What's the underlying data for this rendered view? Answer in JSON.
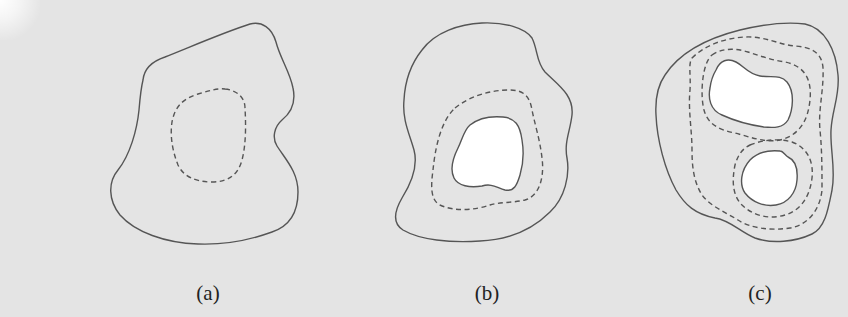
{
  "figure": {
    "background_color": "#e4e4e4",
    "line_color": "#555555",
    "hole_color": "#ffffff",
    "panels": [
      {
        "label": "(a)",
        "description": "Irregular closed region (solid boundary) with a single dashed interior contour, no hole",
        "dashed_contours": 1,
        "holes": 0
      },
      {
        "label": "(b)",
        "description": "Closed region (solid boundary) containing one white hole and one dashed contour surrounding the hole",
        "dashed_contours": 1,
        "holes": 1
      },
      {
        "label": "(c)",
        "description": "Closed region (solid boundary) containing two white holes, each surrounded by dashed contours, plus an outer dashed contour enclosing both",
        "dashed_contours": 3,
        "holes": 2
      }
    ]
  }
}
